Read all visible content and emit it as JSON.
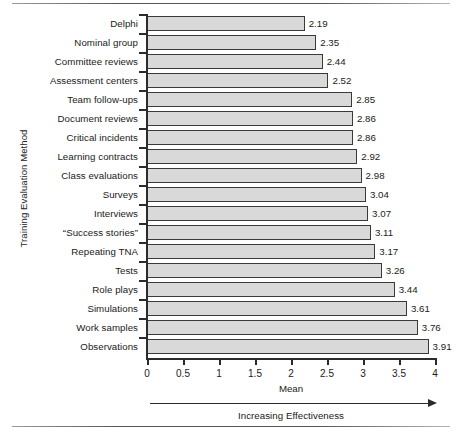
{
  "chart_data": {
    "type": "bar",
    "orientation": "horizontal",
    "title": "",
    "xlabel": "Mean",
    "ylabel": "Training Evaluation Method",
    "xlim": [
      0,
      4
    ],
    "xticks": [
      "0",
      "0.5",
      "1",
      "1.5",
      "2",
      "2.5",
      "3",
      "3.5",
      "4"
    ],
    "xtick_values": [
      0,
      0.5,
      1,
      1.5,
      2,
      2.5,
      3,
      3.5,
      4
    ],
    "grid": false,
    "legend": null,
    "annotation": "Increasing Effectiveness",
    "categories": [
      "Delphi",
      "Nominal group",
      "Committee reviews",
      "Assessment centers",
      "Team follow-ups",
      "Document reviews",
      "Critical incidents",
      "Learning contracts",
      "Class evaluations",
      "Surveys",
      "Interviews",
      "“Success stories”",
      "Repeating TNA",
      "Tests",
      "Role plays",
      "Simulations",
      "Work samples",
      "Observations"
    ],
    "values": [
      2.19,
      2.35,
      2.44,
      2.52,
      2.85,
      2.86,
      2.86,
      2.92,
      2.98,
      3.04,
      3.07,
      3.11,
      3.17,
      3.26,
      3.44,
      3.61,
      3.76,
      3.91
    ],
    "value_labels": [
      "2.19",
      "2.35",
      "2.44",
      "2.52",
      "2.85",
      "2.86",
      "2.86",
      "2.92",
      "2.98",
      "3.04",
      "3.07",
      "3.11",
      "3.17",
      "3.26",
      "3.44",
      "3.61",
      "3.76",
      "3.91"
    ],
    "bar_fill_color": "#d9d9d9",
    "bar_edge_color": "#3a3a3a",
    "axis_color": "#2b2b2b"
  }
}
